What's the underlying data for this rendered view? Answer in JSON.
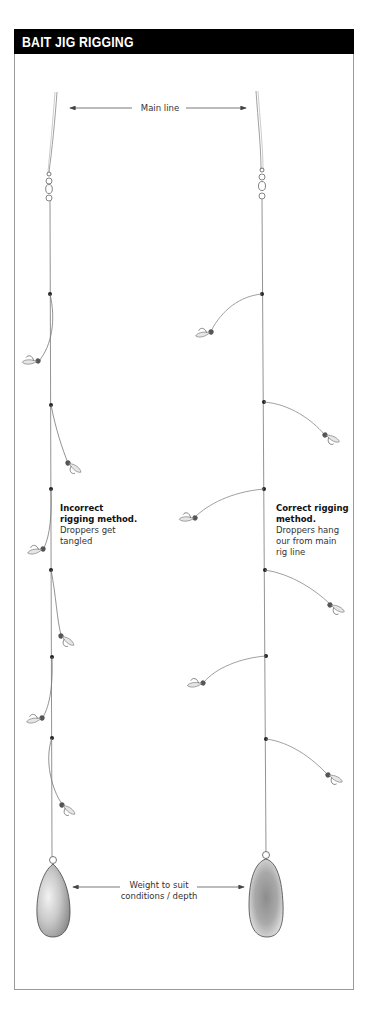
{
  "title": "BAIT JIG RIGGING",
  "labels": {
    "main_line": "Main line",
    "weight": [
      "Weight to suit",
      "conditions / depth"
    ],
    "incorrect": {
      "heading": [
        "Incorrect",
        "rigging method."
      ],
      "body": [
        "Droppers get",
        "tangled"
      ]
    },
    "correct": {
      "heading": [
        "Correct rigging",
        "method."
      ],
      "body": [
        "Droppers hang",
        "our from main",
        "rig line"
      ]
    }
  },
  "rigs": [
    {
      "name": "incorrect-rig",
      "dropper_count": 6,
      "dropper_style": "tangled"
    },
    {
      "name": "correct-rig",
      "dropper_count": 6,
      "dropper_style": "hanging-out"
    }
  ],
  "colors": {
    "title_bg": "#000000",
    "title_text": "#ffffff",
    "line": "#6e6e6e",
    "knot": "#222222",
    "border": "#9a9a9a"
  }
}
